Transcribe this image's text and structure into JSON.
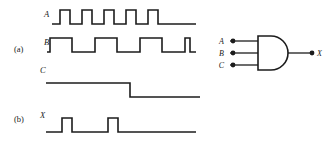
{
  "figure": {
    "type": "digital-logic-timing-diagram",
    "parts": [
      {
        "key": "a",
        "label": "(a)",
        "caption_x": 14,
        "caption_y": 52
      },
      {
        "key": "b",
        "label": "(b)",
        "caption_x": 14,
        "caption_y": 122
      }
    ],
    "signal_labels": {
      "a_wave": "A",
      "b_wave": "B",
      "c_wave": "C",
      "x_wave": "X"
    },
    "gate": {
      "kind": "AND",
      "input_labels": [
        "A",
        "B",
        "C"
      ],
      "output_label": "X",
      "input_count": 3
    },
    "line_color": "#1c1c1c",
    "background_color": "#ffffff"
  },
  "chart_data": {
    "type": "line",
    "title": "",
    "xlabel": "",
    "ylabel": "",
    "grid": false,
    "legend": "none",
    "xlim": [
      0,
      220
    ],
    "waveforms": [
      {
        "name": "A",
        "part": "a",
        "label_x": 44,
        "label_y": 17,
        "baseline_y": 24,
        "high_y": 10,
        "x_start": 52,
        "x_end": 196,
        "period": 22,
        "pulse_width": 10,
        "pulse_count": 5,
        "first_rise_x": 60,
        "points": [
          [
            52,
            24
          ],
          [
            60,
            24
          ],
          [
            60,
            10
          ],
          [
            70,
            10
          ],
          [
            70,
            24
          ],
          [
            82,
            24
          ],
          [
            82,
            10
          ],
          [
            92,
            10
          ],
          [
            92,
            24
          ],
          [
            104,
            24
          ],
          [
            104,
            10
          ],
          [
            114,
            10
          ],
          [
            114,
            24
          ],
          [
            126,
            24
          ],
          [
            126,
            10
          ],
          [
            136,
            10
          ],
          [
            136,
            24
          ],
          [
            148,
            24
          ],
          [
            148,
            10
          ],
          [
            158,
            10
          ],
          [
            158,
            24
          ],
          [
            196,
            24
          ]
        ]
      },
      {
        "name": "B",
        "part": "a",
        "label_x": 44,
        "label_y": 45,
        "baseline_y": 52,
        "high_y": 38,
        "x_start": 47,
        "x_end": 196,
        "period": 45,
        "pulse_width": 22,
        "pulse_count": 4,
        "first_rise_x": 50,
        "points": [
          [
            47,
            52
          ],
          [
            50,
            52
          ],
          [
            50,
            38
          ],
          [
            72,
            38
          ],
          [
            72,
            52
          ],
          [
            95,
            52
          ],
          [
            95,
            38
          ],
          [
            117,
            38
          ],
          [
            117,
            52
          ],
          [
            140,
            52
          ],
          [
            140,
            38
          ],
          [
            162,
            38
          ],
          [
            162,
            52
          ],
          [
            185,
            52
          ],
          [
            185,
            38
          ],
          [
            190,
            38
          ],
          [
            190,
            52
          ],
          [
            196,
            52
          ]
        ]
      },
      {
        "name": "C",
        "part": "a",
        "label_x": 40,
        "label_y": 73,
        "baseline_y": 97,
        "high_y": 83,
        "x_start": 46,
        "x_end": 200,
        "fall_x": 130,
        "points": [
          [
            46,
            83
          ],
          [
            130,
            83
          ],
          [
            130,
            97
          ],
          [
            200,
            97
          ]
        ]
      },
      {
        "name": "X",
        "part": "b",
        "label_x": 40,
        "label_y": 118,
        "baseline_y": 132,
        "high_y": 118,
        "x_start": 46,
        "x_end": 196,
        "pulse_count": 2,
        "points": [
          [
            46,
            132
          ],
          [
            62,
            132
          ],
          [
            62,
            118
          ],
          [
            72,
            118
          ],
          [
            72,
            132
          ],
          [
            108,
            132
          ],
          [
            108,
            118
          ],
          [
            118,
            118
          ],
          [
            118,
            132
          ],
          [
            196,
            132
          ]
        ]
      }
    ],
    "gate_geometry": {
      "body_left": 258,
      "body_right": 288,
      "body_top": 36,
      "body_bottom": 70,
      "arc_radius": 17,
      "input_pin_x": 230,
      "input_dot_x": 233,
      "input_ys": [
        41,
        53,
        65
      ],
      "output_y": 53,
      "output_dot_x": 312,
      "output_line_end": 312,
      "input_label_x": 224,
      "output_label_x": 317
    }
  }
}
